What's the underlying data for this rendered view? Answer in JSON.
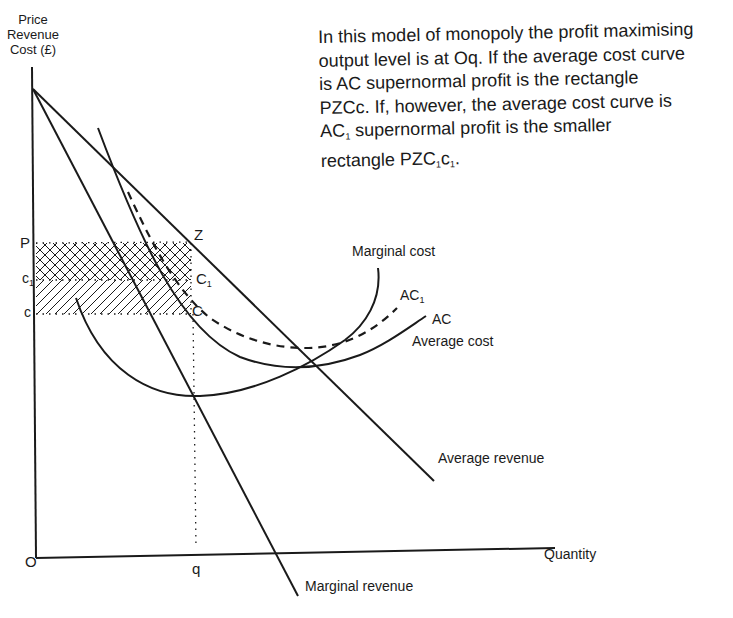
{
  "diagram": {
    "type": "monopoly-cost-revenue",
    "y_axis_label": [
      "Price",
      "Revenue",
      "Cost (£)"
    ],
    "x_axis_label": "Quantity",
    "origin_label": "O",
    "caption": {
      "line1": "In this model of monopoly the profit maximising",
      "line2": "output level is at Oq. If the average cost curve",
      "line3": "is AC supernormal profit is the rectangle",
      "line4": "PZCc. If, however, the average cost curve is",
      "line5_a": "AC",
      "line5_sub": "1",
      "line5_b": " supernormal profit is the smaller",
      "line6_a": "rectangle PZC",
      "line6_sub1": "1",
      "line6_b": "c",
      "line6_sub2": "1",
      "line6_c": "."
    },
    "point_labels": {
      "P": "P",
      "c1": "c",
      "c1_sub": "1",
      "c": "c",
      "Z": "Z",
      "C1": "C",
      "C1_sub": "1",
      "C": "C",
      "q": "q"
    },
    "curve_labels": {
      "marginal_cost": "Marginal cost",
      "ac1": "AC",
      "ac1_sub": "1",
      "ac": "AC",
      "average_cost": "Average cost",
      "average_revenue": "Average revenue",
      "marginal_revenue": "Marginal revenue"
    },
    "curves": [
      {
        "name": "Average revenue",
        "style": "solid",
        "shape": "straight line, downward sloping"
      },
      {
        "name": "Marginal revenue",
        "style": "solid",
        "shape": "straight line, steeper, crosses quantity axis"
      },
      {
        "name": "Marginal cost",
        "style": "solid",
        "shape": "U-shaped, rising through AC minimum"
      },
      {
        "name": "AC (Average cost)",
        "style": "solid",
        "shape": "U-shaped"
      },
      {
        "name": "AC1",
        "style": "dashed",
        "shape": "U-shaped, above AC"
      }
    ],
    "regions": [
      {
        "name": "PZC1c1",
        "fill": "cross-hatch",
        "meaning": "supernormal profit with AC1"
      },
      {
        "name": "c1C1Cc",
        "fill": "diagonal hatch",
        "meaning": "additional profit with AC (total PZCc)"
      }
    ],
    "colors": {
      "ink": "#1a1a1a",
      "background": "#ffffff"
    }
  }
}
